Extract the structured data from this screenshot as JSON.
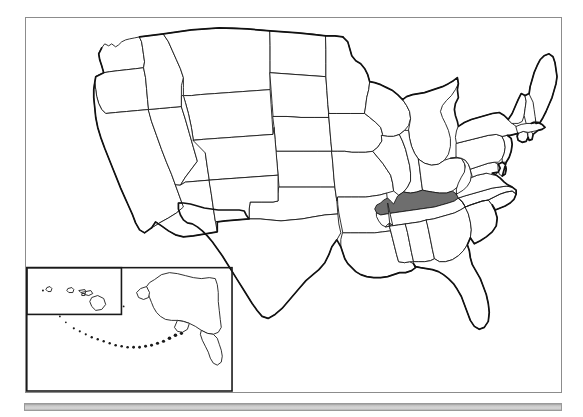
{
  "document": {
    "type": "image",
    "subject": "Blank outline map of the United States with one state shaded"
  },
  "map": {
    "title": "United States outline map",
    "projection_note": "Contiguous United States with Alaska and Hawaii insets",
    "border_color": "#8c8c8c",
    "outline_color": "#1a1a1a",
    "state_fill": "#ffffff",
    "highlight_fill": "#6e6e6e",
    "highlighted_states": [
      {
        "name": "Kentucky",
        "abbr": "KY",
        "fill": "#6e6e6e"
      }
    ],
    "insets": [
      {
        "name": "Alaska",
        "abbr": "AK"
      },
      {
        "name": "Hawaii",
        "abbr": "HI"
      }
    ],
    "regions": [
      "Washington",
      "Oregon",
      "California",
      "Nevada",
      "Idaho",
      "Montana",
      "Wyoming",
      "Utah",
      "Arizona",
      "Colorado",
      "New Mexico",
      "North Dakota",
      "South Dakota",
      "Nebraska",
      "Kansas",
      "Oklahoma",
      "Texas",
      "Minnesota",
      "Iowa",
      "Missouri",
      "Arkansas",
      "Louisiana",
      "Wisconsin",
      "Illinois",
      "Michigan",
      "Indiana",
      "Ohio",
      "Kentucky",
      "Tennessee",
      "Mississippi",
      "Alabama",
      "Georgia",
      "Florida",
      "South Carolina",
      "North Carolina",
      "Virginia",
      "West Virginia",
      "Maryland",
      "Delaware",
      "Pennsylvania",
      "New Jersey",
      "New York",
      "Connecticut",
      "Rhode Island",
      "Massachusetts",
      "Vermont",
      "New Hampshire",
      "Maine",
      "Alaska",
      "Hawaii"
    ]
  },
  "bottom_bar": {
    "label": "",
    "color": "#c9c9c9"
  }
}
